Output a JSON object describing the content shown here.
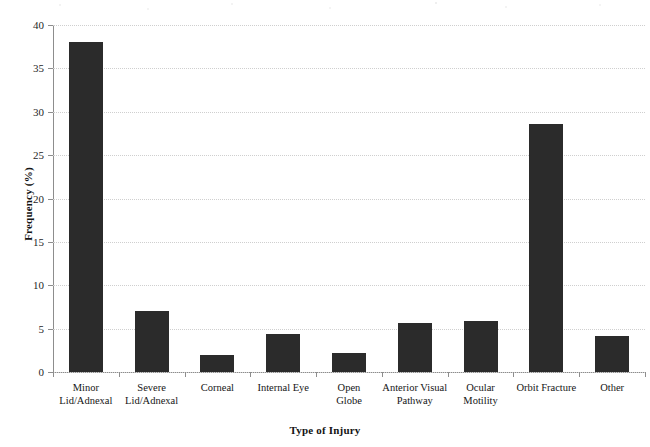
{
  "chart_data": {
    "type": "bar",
    "title": "",
    "xlabel": "Type of Injury",
    "ylabel": "Frequency (%)",
    "categories": [
      "Minor Lid/Adnexal",
      "Severe Lid/Adnexal",
      "Corneal",
      "Internal Eye",
      "Open Globe",
      "Anterior Visual Pathway",
      "Ocular Motility",
      "Orbit Fracture",
      "Other"
    ],
    "category_lines": [
      [
        "Minor",
        "Lid/Adnexal"
      ],
      [
        "Severe",
        "Lid/Adnexal"
      ],
      [
        "Corneal",
        ""
      ],
      [
        "Internal Eye",
        ""
      ],
      [
        "Open",
        "Globe"
      ],
      [
        "Anterior Visual",
        "Pathway"
      ],
      [
        "Ocular",
        "Motility"
      ],
      [
        "Orbit Fracture",
        ""
      ],
      [
        "Other",
        ""
      ]
    ],
    "values": [
      38.0,
      7.0,
      2.0,
      4.4,
      2.2,
      5.6,
      5.9,
      28.6,
      4.1
    ],
    "ylim": [
      0,
      40
    ],
    "yticks": [
      0,
      5,
      10,
      15,
      20,
      25,
      30,
      35,
      40
    ],
    "ytick_labels": [
      "0",
      "5",
      "10",
      "15",
      "20",
      "25",
      "30",
      "35",
      "40"
    ],
    "grid": true,
    "legend": false,
    "bar_color": "#2b2b2b",
    "grid_color": "#cfcfcf",
    "axis_color": "#8d8d8d"
  }
}
